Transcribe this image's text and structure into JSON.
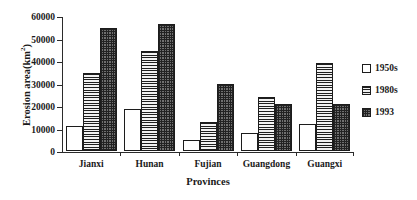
{
  "chart_data": {
    "type": "bar",
    "title": "",
    "xlabel": "Provinces",
    "ylabel": "Erosion area(km2)",
    "ylabel_base": "Erosion area(km",
    "ylabel_sup": "2",
    "ylabel_tail": ")",
    "categories": [
      "Jianxi",
      "Hunan",
      "Fujian",
      "Guangdong",
      "Guangxi"
    ],
    "series": [
      {
        "name": "1950s",
        "pattern": "solid-white",
        "values": [
          11000,
          18500,
          5000,
          8000,
          12000
        ]
      },
      {
        "name": "1980s",
        "pattern": "horizontal-stripes",
        "values": [
          34500,
          44500,
          13000,
          24000,
          39000
        ]
      },
      {
        "name": "1993",
        "pattern": "checkerboard",
        "values": [
          54500,
          56500,
          30000,
          21000,
          21000
        ]
      }
    ],
    "ylim": [
      0,
      60000
    ],
    "ytick_step": 10000,
    "yticks": [
      0,
      10000,
      20000,
      30000,
      40000,
      50000,
      60000
    ],
    "ytick_labels": [
      "0",
      "10000",
      "20000",
      "30000",
      "40000",
      "50000",
      "60000"
    ],
    "grid": false,
    "legend_position": "right",
    "legend": [
      "1950s",
      "1980s",
      "1993"
    ],
    "colors": {
      "axis": "#2b2b2b",
      "bar_outline": "#1c1c1c",
      "series_1950s": "#ffffff",
      "series_1980s": "#8a8a8a",
      "series_1993": "#6f6f6f",
      "background": "#ffffff"
    }
  }
}
